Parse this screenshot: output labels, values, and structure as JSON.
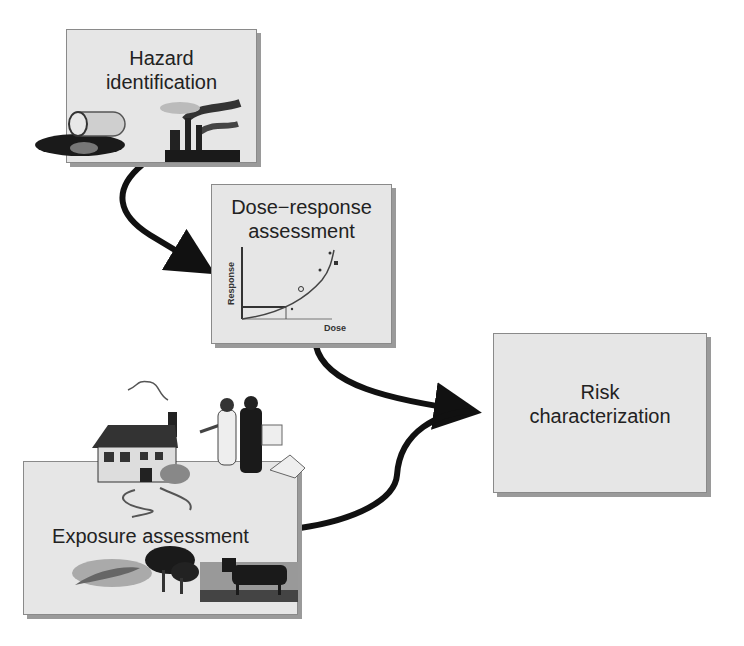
{
  "diagram": {
    "nodes": [
      {
        "id": "hazard",
        "line1": "Hazard",
        "line2": "identification"
      },
      {
        "id": "dose",
        "line1": "Dose−response",
        "line2": "assessment"
      },
      {
        "id": "exposure",
        "line1": "Exposure assessment"
      },
      {
        "id": "risk",
        "line1": "Risk",
        "line2": "characterization"
      }
    ],
    "dose_chart": {
      "ylabel": "Response",
      "xlabel": "Dose"
    },
    "edges": [
      {
        "from": "hazard",
        "to": "dose"
      },
      {
        "from": "dose",
        "to": "risk"
      },
      {
        "from": "exposure",
        "to": "risk"
      }
    ],
    "colors": {
      "box_fill": "#e6e6e6",
      "box_border": "#8a8a8a",
      "arrow": "#111111"
    }
  }
}
